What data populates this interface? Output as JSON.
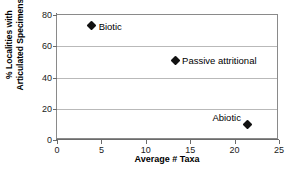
{
  "chart_data": {
    "type": "scatter",
    "title": "",
    "xlabel": "Average # Taxa",
    "ylabel": "% Localities with Articulated Specimens",
    "ylabel_line1": "% Localities with",
    "ylabel_line2": "Articulated Specimens",
    "xlim": [
      0,
      25
    ],
    "ylim": [
      0,
      80
    ],
    "xticks": [
      "0",
      "5",
      "10",
      "15",
      "20",
      "25"
    ],
    "yticks": [
      "0",
      "20",
      "40",
      "60",
      "80"
    ],
    "gridlines": {
      "horizontal": [
        20,
        40,
        60
      ],
      "vertical": []
    },
    "legend": "none",
    "marker_color": "#111111",
    "grid_color": "#b9b9b9",
    "axis_color": "#6b6b6b",
    "points": [
      {
        "label": "Biotic",
        "x": 3.9,
        "y": 73,
        "label_side": "right"
      },
      {
        "label": "Passive attritional",
        "x": 13.3,
        "y": 51,
        "label_side": "right"
      },
      {
        "label": "Abiotic",
        "x": 21.5,
        "y": 10,
        "label_side": "left"
      }
    ]
  }
}
